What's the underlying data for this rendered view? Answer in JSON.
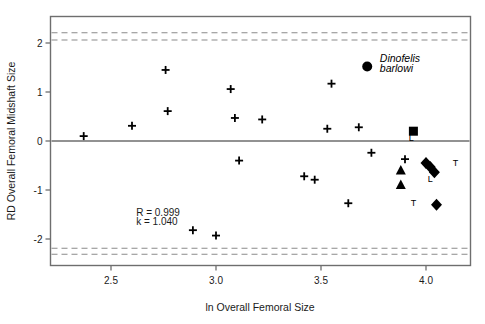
{
  "chart_data": {
    "type": "scatter",
    "title": "",
    "xlabel": "ln Overall Femoral Size",
    "ylabel": "RD Overall Femoral Midshaft Size",
    "xlim": [
      2.26,
      4.24
    ],
    "ylim": [
      -2.54,
      2.63
    ],
    "xticks": [
      2.5,
      3.0,
      3.5,
      4.0
    ],
    "xtick_labels": [
      "2.5",
      "3.0",
      "3.5",
      "4.0"
    ],
    "yticks": [
      2,
      1,
      0,
      -1,
      -2
    ],
    "ytick_labels": [
      "2",
      "1",
      "0",
      "-1",
      "-2"
    ],
    "grid": false,
    "legend": "none",
    "zero_line": 0,
    "reference_bands": {
      "description": "dashed horizontal confidence limit lines",
      "upper": [
        2.21,
        2.06
      ],
      "lower": [
        -2.19,
        -2.31
      ],
      "color": "#8a8a8a",
      "style": "dashed"
    },
    "annotations": [
      {
        "name": "correlation",
        "text": "R = 0.999",
        "x": 2.62,
        "y": -1.53
      },
      {
        "name": "slope",
        "text": "k = 1.040",
        "x": 2.62,
        "y": -1.72
      },
      {
        "name": "species-line1",
        "text": "Dinofelis",
        "x": 3.78,
        "y": 1.62
      },
      {
        "name": "species-line2",
        "text": "barlowi",
        "x": 3.78,
        "y": 1.4
      }
    ],
    "series": [
      {
        "name": "Comparative felid sample",
        "marker": "plus",
        "color": "#000000",
        "points": [
          {
            "x": 2.37,
            "y": 0.1
          },
          {
            "x": 2.6,
            "y": 0.31
          },
          {
            "x": 2.76,
            "y": 1.45
          },
          {
            "x": 2.77,
            "y": 0.61
          },
          {
            "x": 2.89,
            "y": -1.82
          },
          {
            "x": 3.0,
            "y": -1.93
          },
          {
            "x": 3.07,
            "y": 1.06
          },
          {
            "x": 3.09,
            "y": 0.47
          },
          {
            "x": 3.11,
            "y": -0.4
          },
          {
            "x": 3.22,
            "y": 0.44
          },
          {
            "x": 3.42,
            "y": -0.72
          },
          {
            "x": 3.47,
            "y": -0.79
          },
          {
            "x": 3.53,
            "y": 0.25
          },
          {
            "x": 3.55,
            "y": 1.17
          },
          {
            "x": 3.63,
            "y": -1.27
          },
          {
            "x": 3.68,
            "y": 0.28
          },
          {
            "x": 3.74,
            "y": -0.24
          },
          {
            "x": 3.9,
            "y": -0.37
          }
        ]
      },
      {
        "name": "Dinofelis barlowi",
        "marker": "circle",
        "color": "#000000",
        "points": [
          {
            "x": 3.72,
            "y": 1.52
          }
        ]
      },
      {
        "name": "Square specimen",
        "marker": "square",
        "color": "#000000",
        "label": "L",
        "points": [
          {
            "x": 3.94,
            "y": 0.2,
            "label": "L",
            "label_pos": "below"
          }
        ]
      },
      {
        "name": "Triangle specimens",
        "marker": "triangle",
        "color": "#000000",
        "points": [
          {
            "x": 3.88,
            "y": -0.6
          },
          {
            "x": 3.88,
            "y": -0.9
          }
        ]
      },
      {
        "name": "Diamond specimens",
        "marker": "diamond",
        "color": "#000000",
        "points": [
          {
            "x": 4.0,
            "y": -0.45,
            "label": "",
            "label_pos": ""
          },
          {
            "x": 4.02,
            "y": -0.53,
            "label": "",
            "label_pos": ""
          },
          {
            "x": 4.04,
            "y": -0.64,
            "label": "T",
            "label_pos": "right"
          },
          {
            "x": 4.05,
            "y": -1.3,
            "label": "T",
            "label_pos": "left"
          }
        ]
      }
    ],
    "point_labels": [
      {
        "text": "L",
        "x": 3.93,
        "y": 0.0
      },
      {
        "text": "T",
        "x": 4.14,
        "y": -0.52
      },
      {
        "text": "L",
        "x": 4.02,
        "y": -0.83
      },
      {
        "text": "T",
        "x": 3.94,
        "y": -1.33
      }
    ]
  },
  "figure": {
    "background": "#ffffff",
    "axis_color": "#6e6e6e",
    "dash_color": "#8a8a8a",
    "text_color": "#1a1a1a"
  }
}
